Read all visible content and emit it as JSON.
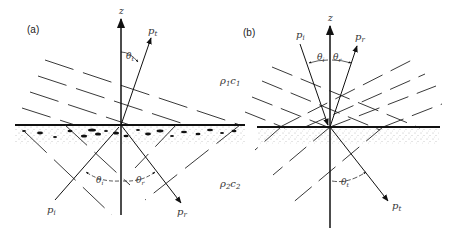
{
  "figure": {
    "panels": [
      {
        "id": "a",
        "label": "(a)",
        "axis_label": "z",
        "rays": {
          "incident": "p",
          "incident_sub": "i",
          "reflected": "p",
          "reflected_sub": "r",
          "transmitted": "p",
          "transmitted_sub": "t"
        },
        "angles": {
          "theta_i": "θ",
          "theta_i_sub": "i",
          "theta_r": "θ",
          "theta_r_sub": "r",
          "theta_t": "θ",
          "theta_t_sub": "t"
        }
      },
      {
        "id": "b",
        "label": "(b)",
        "axis_label": "z",
        "rays": {
          "incident": "p",
          "incident_sub": "i",
          "reflected": "p",
          "reflected_sub": "r",
          "transmitted": "p",
          "transmitted_sub": "t"
        },
        "angles": {
          "theta_i": "θ",
          "theta_i_sub": "i",
          "theta_r": "θ",
          "theta_r_sub": "r",
          "theta_t": "θ",
          "theta_t_sub": "t"
        }
      }
    ],
    "media": {
      "upper": {
        "rho": "ρ",
        "rho_sub": "1",
        "c": "c",
        "c_sub": "1"
      },
      "lower": {
        "rho": "ρ",
        "rho_sub": "2",
        "c": "c",
        "c_sub": "2"
      }
    },
    "colors": {
      "line": "#1a1a1a",
      "dash": "#222222",
      "stipple": "#555555"
    }
  }
}
